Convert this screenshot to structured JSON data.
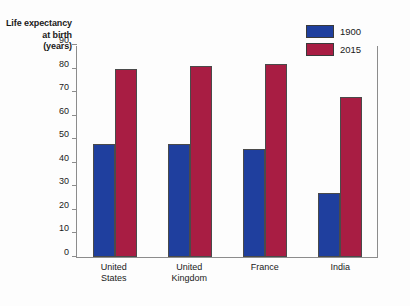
{
  "chart_data": {
    "type": "bar",
    "title": "",
    "subtitle": "",
    "xlabel": "",
    "ylabel": "Life expectancy at birth (years)",
    "ylabel_lines": [
      "Life expectancy",
      "at birth",
      "(years)"
    ],
    "categories": [
      "United States",
      "United Kingdom",
      "France",
      "India"
    ],
    "category_lines": [
      [
        "United",
        "States"
      ],
      [
        "United",
        "Kingdom"
      ],
      [
        "France"
      ],
      [
        "India"
      ]
    ],
    "series": [
      {
        "name": "1900",
        "color": "#1f3f9e",
        "values": [
          48,
          48,
          46,
          27
        ]
      },
      {
        "name": "2015",
        "color": "#a81d43",
        "values": [
          80,
          81,
          82,
          68
        ]
      }
    ],
    "ylim": [
      0,
      90
    ],
    "ytick_step": 10,
    "yticks": [
      0,
      10,
      20,
      30,
      40,
      50,
      60,
      70,
      80,
      90
    ],
    "ytick_labels": [
      "0",
      "10",
      "20",
      "30",
      "40",
      "50",
      "60",
      "70",
      "80",
      "90"
    ],
    "grid": false,
    "legend_position": "top-right",
    "legend": [
      {
        "label": "1900",
        "color": "#1f3f9e"
      },
      {
        "label": "2015",
        "color": "#a81d43"
      }
    ]
  }
}
